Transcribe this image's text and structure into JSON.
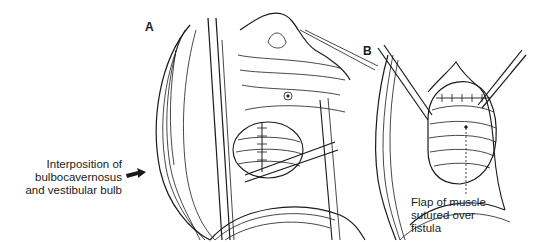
{
  "figure": {
    "panels": [
      {
        "letter": "A"
      },
      {
        "letter": "B"
      }
    ],
    "labels": {
      "interposition": {
        "lines": [
          "Interposition of",
          "bulbocavernosus",
          "and vestibular bulb"
        ]
      },
      "flap": {
        "lines": [
          "Flap of muscle",
          "sutured over",
          "fistula"
        ]
      }
    },
    "colors": {
      "ink": "#1a1a1a",
      "background": "#ffffff"
    }
  }
}
